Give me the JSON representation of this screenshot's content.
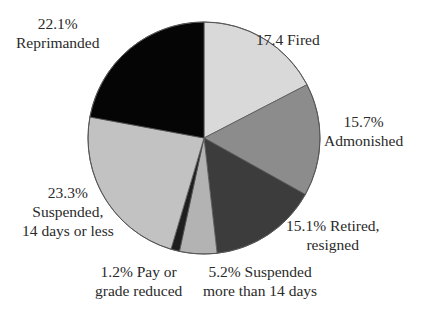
{
  "chart_data": {
    "type": "pie",
    "title": "",
    "start_angle_deg": 0,
    "direction": "clockwise",
    "slices": [
      {
        "name": "Fired",
        "value": 17.4,
        "label_lines": [
          "17.4 Fired"
        ],
        "color": "#d9d9d9"
      },
      {
        "name": "Admonished",
        "value": 15.7,
        "label_lines": [
          "15.7%",
          "Admonished"
        ],
        "color": "#8c8c8c"
      },
      {
        "name": "Retired, resigned",
        "value": 15.1,
        "label_lines": [
          "15.1% Retired,",
          "resigned"
        ],
        "color": "#3c3c3c"
      },
      {
        "name": "Suspended more than 14 days",
        "value": 5.2,
        "label_lines": [
          "5.2% Suspended",
          "more than 14 days"
        ],
        "color": "#b3b3b3"
      },
      {
        "name": "Pay or grade reduced",
        "value": 1.2,
        "label_lines": [
          "1.2% Pay or",
          "grade reduced"
        ],
        "color": "#1e1e1e"
      },
      {
        "name": "Suspended, 14 days or less",
        "value": 23.3,
        "label_lines": [
          "23.3%",
          "Suspended,",
          "14 days or less"
        ],
        "color": "#c2c2c2"
      },
      {
        "name": "Reprimanded",
        "value": 22.1,
        "label_lines": [
          "22.1%",
          "Reprimanded"
        ],
        "color": "#050505"
      }
    ],
    "legend": "none (direct labels)",
    "stroke_color": "#555555"
  }
}
